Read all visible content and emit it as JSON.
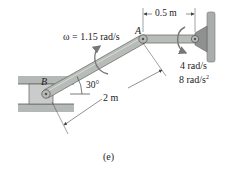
{
  "figure": {
    "caption": "(e)",
    "colors": {
      "link": "#b8bcb8",
      "link_edge": "#6e726e",
      "support": "#b4b8b6",
      "support_dark": "#8d918f",
      "dimension_line": "#444444",
      "arrow": "#777777",
      "text": "#222222"
    },
    "points": {
      "A": {
        "label": "A",
        "x": 143,
        "y": 39
      },
      "B": {
        "label": "B",
        "x": 46,
        "y": 94
      },
      "C": {
        "x": 195,
        "y": 39
      }
    },
    "labels": {
      "omega_AB": "ω = 1.15 rad/s",
      "angle": "30°",
      "length_AB": "2 m",
      "length_CA": "0.5 m",
      "omega_CA": "4 rad/s",
      "alpha_CA_num": "8 rad/s",
      "alpha_CA_exp": "2",
      "point_A": "A",
      "point_B": "B"
    },
    "values": {
      "angular_velocity_AB_rad_s": 1.15,
      "angle_deg": 30,
      "length_AB_m": 2,
      "length_CA_m": 0.5,
      "angular_velocity_CA_rad_s": 4,
      "angular_acceleration_CA_rad_s2": 8
    }
  }
}
